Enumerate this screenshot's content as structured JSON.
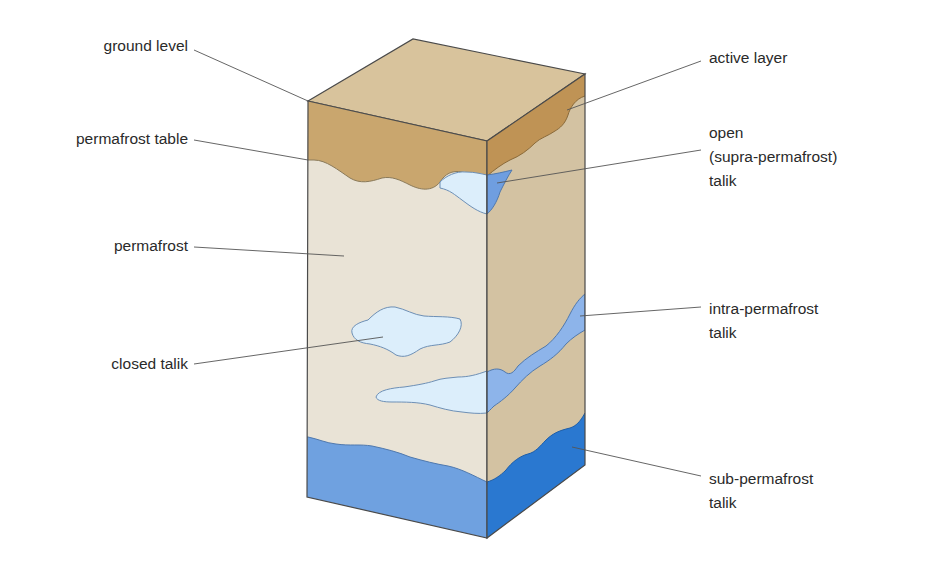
{
  "diagram": {
    "type": "block-diagram",
    "colors": {
      "active_layer_front": "#c9a66e",
      "active_layer_right": "#bf9355",
      "top_surface": "#d8c39c",
      "permafrost_front": "#e9e3d6",
      "permafrost_right": "#d3c2a2",
      "talik_light": "#dceefb",
      "talik_medium": "#6f9ee0",
      "sub_permafrost_front": "#6fa1e0",
      "sub_permafrost_right": "#2a78d0",
      "outline": "#4a4a4a",
      "leader_line": "#555555",
      "label_text": "#2a2a2a"
    },
    "labels_left": [
      {
        "id": "ground-level",
        "text": "ground level"
      },
      {
        "id": "permafrost-table",
        "text": "permafrost table"
      },
      {
        "id": "permafrost",
        "text": "permafrost"
      },
      {
        "id": "closed-talik",
        "text": "closed talik"
      }
    ],
    "labels_right": [
      {
        "id": "active-layer",
        "text": "active layer"
      },
      {
        "id": "open-talik",
        "lines": [
          "open",
          "(supra-permafrost)",
          "talik"
        ]
      },
      {
        "id": "intra-permafrost-talik",
        "lines": [
          "intra-permafrost",
          "talik"
        ]
      },
      {
        "id": "sub-permafrost-talik",
        "lines": [
          "sub-permafrost",
          "talik"
        ]
      }
    ]
  }
}
